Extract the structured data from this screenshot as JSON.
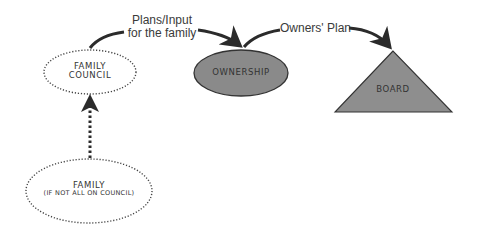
{
  "diagram": {
    "type": "governance-flow",
    "colors": {
      "arrow": "#2b2b2b",
      "dotted_outline": "#444444",
      "ownership_fill": "#8a8a8a",
      "board_fill": "#8e8e8e",
      "outline": "#333333",
      "text": "#333333"
    },
    "nodes": {
      "family_council": {
        "line1": "FAMILY",
        "line2": "COUNCIL",
        "shape": "dotted-ellipse"
      },
      "ownership": {
        "label": "OWNERSHIP",
        "shape": "filled-ellipse"
      },
      "board": {
        "label": "BOARD",
        "shape": "filled-triangle"
      },
      "family": {
        "line1": "FAMILY",
        "line2": "(IF NOT ALL ON COUNCIL)",
        "shape": "dotted-ellipse"
      }
    },
    "edges": {
      "council_to_ownership": {
        "line1": "Plans/Input",
        "line2": "for the family"
      },
      "ownership_to_board": {
        "label": "Owners' Plan"
      },
      "family_to_council": {
        "style": "dotted-arrow"
      }
    }
  }
}
